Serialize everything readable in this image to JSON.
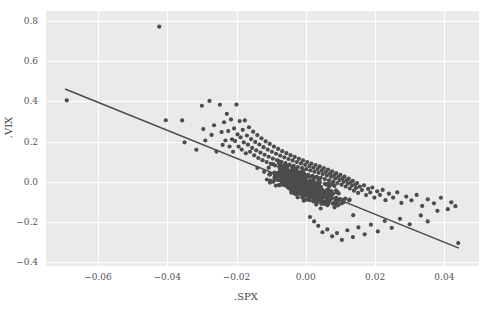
{
  "chart_data": {
    "type": "scatter",
    "title": "",
    "xlabel": ".SPX",
    "ylabel": ".VIX",
    "xlim": [
      -0.075,
      0.05
    ],
    "ylim": [
      -0.42,
      0.85
    ],
    "xticks": [
      -0.06,
      -0.04,
      -0.02,
      0.0,
      0.02,
      0.04
    ],
    "xtick_labels": [
      "−0.06",
      "−0.04",
      "−0.02",
      "0.00",
      "0.02",
      "0.04"
    ],
    "yticks": [
      0.8,
      0.6,
      0.4,
      0.2,
      0.0,
      -0.2,
      -0.4
    ],
    "ytick_labels": [
      "0.8",
      "0.6",
      "0.4",
      "0.2",
      "0.0",
      "−0.2",
      "−0.4"
    ],
    "grid": true,
    "legend": null,
    "marker_color": "#4c4c4c",
    "marker_size": 3,
    "background_color": "#eaeaea",
    "grid_color": "#ffffff",
    "regression_line": {
      "color": "#4c4c4c",
      "x_start": -0.0695,
      "y_start": 0.462,
      "x_end": 0.0442,
      "y_end": -0.331,
      "slope": -6.97,
      "intercept": -0.0226
    },
    "n_points": 760,
    "annotations": [],
    "points": [
      [
        -0.069,
        0.405
      ],
      [
        -0.0423,
        0.772
      ],
      [
        -0.0404,
        0.306
      ],
      [
        -0.0357,
        0.305
      ],
      [
        -0.035,
        0.196
      ],
      [
        -0.0316,
        0.159
      ],
      [
        -0.03,
        0.378
      ],
      [
        -0.0296,
        0.262
      ],
      [
        -0.029,
        0.205
      ],
      [
        -0.0278,
        0.402
      ],
      [
        -0.0272,
        0.233
      ],
      [
        -0.0265,
        0.281
      ],
      [
        -0.0258,
        0.15
      ],
      [
        -0.0248,
        0.383
      ],
      [
        -0.0243,
        0.247
      ],
      [
        -0.024,
        0.183
      ],
      [
        -0.0236,
        0.296
      ],
      [
        -0.0232,
        0.205
      ],
      [
        -0.0228,
        0.338
      ],
      [
        -0.0224,
        0.252
      ],
      [
        -0.022,
        0.175
      ],
      [
        -0.0216,
        0.31
      ],
      [
        -0.0213,
        0.211
      ],
      [
        -0.021,
        0.149
      ],
      [
        -0.0207,
        0.265
      ],
      [
        -0.0204,
        0.202
      ],
      [
        -0.02,
        0.384
      ],
      [
        -0.0197,
        0.236
      ],
      [
        -0.0194,
        0.175
      ],
      [
        -0.0191,
        0.302
      ],
      [
        -0.0188,
        0.221
      ],
      [
        -0.0185,
        0.16
      ],
      [
        -0.0182,
        0.258
      ],
      [
        -0.0179,
        0.196
      ],
      [
        -0.0176,
        0.305
      ],
      [
        -0.0173,
        0.141
      ],
      [
        -0.017,
        0.23
      ],
      [
        -0.0167,
        0.184
      ],
      [
        -0.0164,
        0.271
      ],
      [
        -0.0161,
        0.149
      ],
      [
        -0.0158,
        0.212
      ],
      [
        -0.0155,
        0.168
      ],
      [
        -0.0152,
        0.249
      ],
      [
        -0.0149,
        0.131
      ],
      [
        -0.0146,
        0.198
      ],
      [
        -0.0143,
        0.156
      ],
      [
        -0.014,
        0.232
      ],
      [
        -0.0137,
        0.118
      ],
      [
        -0.0134,
        0.185
      ],
      [
        -0.0131,
        0.145
      ],
      [
        -0.0128,
        0.216
      ],
      [
        -0.0125,
        0.107
      ],
      [
        -0.0122,
        0.172
      ],
      [
        -0.0119,
        0.134
      ],
      [
        -0.0116,
        0.201
      ],
      [
        -0.0113,
        0.098
      ],
      [
        -0.011,
        0.16
      ],
      [
        -0.0107,
        0.124
      ],
      [
        -0.0104,
        0.188
      ],
      [
        -0.0101,
        0.089
      ],
      [
        -0.0098,
        0.149
      ],
      [
        -0.0095,
        0.115
      ],
      [
        -0.0092,
        0.175
      ],
      [
        -0.0089,
        0.081
      ],
      [
        -0.0086,
        0.139
      ],
      [
        -0.0083,
        0.107
      ],
      [
        -0.008,
        0.163
      ],
      [
        -0.0077,
        0.074
      ],
      [
        -0.0074,
        0.13
      ],
      [
        -0.0071,
        0.099
      ],
      [
        -0.0068,
        0.152
      ],
      [
        -0.0065,
        0.067
      ],
      [
        -0.0062,
        0.121
      ],
      [
        -0.0059,
        0.092
      ],
      [
        -0.0056,
        0.142
      ],
      [
        -0.0053,
        0.061
      ],
      [
        -0.005,
        0.113
      ],
      [
        -0.0047,
        0.085
      ],
      [
        -0.0044,
        0.132
      ],
      [
        -0.0041,
        0.055
      ],
      [
        -0.0038,
        0.106
      ],
      [
        -0.0035,
        0.079
      ],
      [
        -0.0032,
        0.123
      ],
      [
        -0.0029,
        0.049
      ],
      [
        -0.0026,
        0.098
      ],
      [
        -0.0023,
        0.073
      ],
      [
        -0.002,
        0.114
      ],
      [
        -0.0017,
        0.044
      ],
      [
        -0.0014,
        0.091
      ],
      [
        -0.0011,
        0.067
      ],
      [
        -0.0008,
        0.106
      ],
      [
        -0.0005,
        0.039
      ],
      [
        -0.0002,
        0.084
      ],
      [
        0.0001,
        0.062
      ],
      [
        0.0004,
        0.098
      ],
      [
        0.0007,
        0.034
      ],
      [
        0.001,
        0.077
      ],
      [
        0.0013,
        0.056
      ],
      [
        0.0016,
        0.09
      ],
      [
        0.0019,
        0.029
      ],
      [
        0.0022,
        0.07
      ],
      [
        0.0025,
        0.05
      ],
      [
        0.0028,
        0.083
      ],
      [
        0.0031,
        0.024
      ],
      [
        0.0034,
        0.063
      ],
      [
        0.0037,
        0.044
      ],
      [
        0.004,
        0.076
      ],
      [
        0.0043,
        0.019
      ],
      [
        0.0046,
        0.056
      ],
      [
        0.0049,
        0.038
      ],
      [
        0.0052,
        0.068
      ],
      [
        0.0055,
        0.013
      ],
      [
        0.0058,
        0.049
      ],
      [
        0.0061,
        0.031
      ],
      [
        0.0064,
        0.06
      ],
      [
        0.0067,
        0.007
      ],
      [
        0.007,
        0.041
      ],
      [
        0.0073,
        0.024
      ],
      [
        0.0076,
        0.052
      ],
      [
        0.0079,
        0.0
      ],
      [
        0.0082,
        0.033
      ],
      [
        0.0085,
        0.016
      ],
      [
        0.0088,
        0.043
      ],
      [
        0.0091,
        -0.007
      ],
      [
        0.0094,
        0.025
      ],
      [
        0.0097,
        0.008
      ],
      [
        0.01,
        0.034
      ],
      [
        0.0103,
        -0.015
      ],
      [
        0.0106,
        0.016
      ],
      [
        0.0109,
        -0.001
      ],
      [
        0.0112,
        0.025
      ],
      [
        0.0115,
        -0.024
      ],
      [
        0.0118,
        0.007
      ],
      [
        0.0121,
        -0.01
      ],
      [
        0.0124,
        0.015
      ],
      [
        0.0127,
        -0.034
      ],
      [
        0.013,
        -0.003
      ],
      [
        0.0133,
        -0.02
      ],
      [
        0.0136,
        0.004
      ],
      [
        0.0139,
        -0.045
      ],
      [
        0.0142,
        -0.014
      ],
      [
        0.0145,
        -0.031
      ],
      [
        0.0148,
        -0.007
      ],
      [
        0.0151,
        -0.056
      ],
      [
        0.0156,
        -0.025
      ],
      [
        0.0162,
        -0.042
      ],
      [
        0.0168,
        -0.018
      ],
      [
        0.0174,
        -0.067
      ],
      [
        0.018,
        -0.036
      ],
      [
        0.0186,
        -0.054
      ],
      [
        0.0192,
        -0.029
      ],
      [
        0.0198,
        -0.079
      ],
      [
        0.0206,
        -0.048
      ],
      [
        0.0214,
        -0.066
      ],
      [
        0.0222,
        -0.041
      ],
      [
        0.023,
        -0.092
      ],
      [
        0.024,
        -0.06
      ],
      [
        0.0252,
        -0.079
      ],
      [
        0.0264,
        -0.053
      ],
      [
        0.0276,
        -0.106
      ],
      [
        0.029,
        -0.074
      ],
      [
        0.0305,
        -0.093
      ],
      [
        0.032,
        -0.066
      ],
      [
        0.0336,
        -0.121
      ],
      [
        0.0352,
        -0.088
      ],
      [
        0.037,
        -0.108
      ],
      [
        0.039,
        -0.08
      ],
      [
        0.041,
        -0.137
      ],
      [
        0.042,
        -0.103
      ],
      [
        0.0432,
        -0.122
      ],
      [
        0.044,
        -0.306
      ],
      [
        0.038,
        -0.145
      ],
      [
        0.0352,
        -0.198
      ],
      [
        0.0332,
        -0.168
      ],
      [
        0.03,
        -0.212
      ],
      [
        0.0272,
        -0.185
      ],
      [
        0.0248,
        -0.23
      ],
      [
        0.0228,
        -0.196
      ],
      [
        0.0208,
        -0.248
      ],
      [
        0.0188,
        -0.214
      ],
      [
        0.017,
        -0.262
      ],
      [
        0.0152,
        -0.228
      ],
      [
        0.0136,
        -0.276
      ],
      [
        0.012,
        -0.242
      ],
      [
        0.0104,
        -0.29
      ],
      [
        0.009,
        -0.256
      ],
      [
        0.0076,
        -0.272
      ],
      [
        0.0062,
        -0.238
      ],
      [
        0.0048,
        -0.252
      ],
      [
        0.0036,
        -0.22
      ],
      [
        0.0024,
        -0.198
      ],
      [
        0.0012,
        -0.176
      ]
    ]
  },
  "figure": {
    "width": 492,
    "height": 310
  }
}
